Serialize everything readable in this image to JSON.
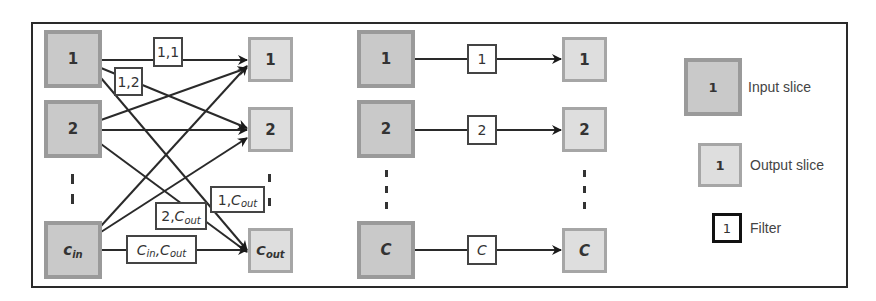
{
  "colors": {
    "input_fill": "#c9c9c9",
    "input_border": "#9a9a9a",
    "output_fill": "#dedede",
    "output_border": "#a6a6a6",
    "filter_border": "#444444",
    "line": "#2a2a2a"
  },
  "standard_conv": {
    "inputs": [
      {
        "label": "1"
      },
      {
        "label": "2"
      },
      {
        "label": "c",
        "sub": "in"
      }
    ],
    "outputs": [
      {
        "label": "1"
      },
      {
        "label": "2"
      },
      {
        "label": "C",
        "sub": "out"
      }
    ],
    "filters": [
      {
        "pre": "1,1",
        "main": "",
        "sub": ""
      },
      {
        "pre": "1,2",
        "main": "",
        "sub": ""
      },
      {
        "pre": "1,",
        "main": "C",
        "sub": "out"
      },
      {
        "pre": "2,",
        "main": "C",
        "sub": "out"
      },
      {
        "pre": "C",
        "pre_sub": "in",
        "main": ",C",
        "sub": "out"
      }
    ]
  },
  "depthwise_conv": {
    "inputs": [
      {
        "label": "1"
      },
      {
        "label": "2"
      },
      {
        "label": "C"
      }
    ],
    "filters": [
      {
        "label": "1"
      },
      {
        "label": "2"
      },
      {
        "label": "C"
      }
    ],
    "outputs": [
      {
        "label": "1"
      },
      {
        "label": "2"
      },
      {
        "label": "C"
      }
    ]
  },
  "legend": {
    "input": {
      "sample": "1",
      "label": "Input slice"
    },
    "output": {
      "sample": "1",
      "label": "Output slice"
    },
    "filter": {
      "sample": "1",
      "label": "Filter"
    }
  }
}
